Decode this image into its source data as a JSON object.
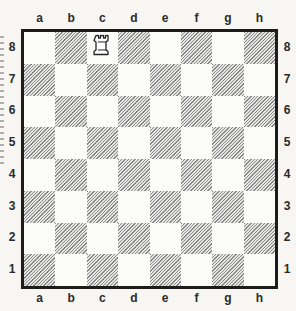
{
  "diagram": {
    "type": "chessboard",
    "files": [
      "a",
      "b",
      "c",
      "d",
      "e",
      "f",
      "g",
      "h"
    ],
    "ranks": [
      "8",
      "7",
      "6",
      "5",
      "4",
      "3",
      "2",
      "1"
    ],
    "square_colors": {
      "light": "#fbfbf8",
      "dark_hatch": "#8a8a8a"
    },
    "pieces": [
      {
        "square": "c8",
        "piece": "rook",
        "color": "white",
        "icon": "white-rook-icon"
      }
    ]
  }
}
